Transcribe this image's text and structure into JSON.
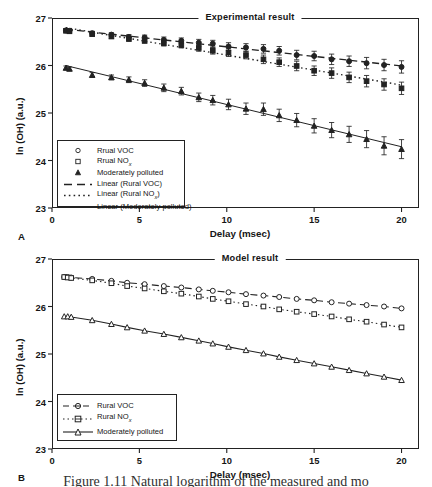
{
  "figure": {
    "caption_fragment": "Figure 1.11   Natural logarithm of the measured and mo"
  },
  "panels": [
    {
      "letter": "A",
      "title": "Experimental result",
      "xlabel": "Delay  (msec)",
      "ylabel": "ln (OH) (a.u.)",
      "xticks": [
        "0",
        "5",
        "10",
        "15",
        "20"
      ],
      "yticks": [
        "23",
        "24",
        "25",
        "26",
        "27"
      ],
      "legend": [
        {
          "text": "Rrual VOC",
          "sub": "",
          "key": "circle-marker"
        },
        {
          "text": "Rrual NO",
          "sub": "x",
          "key": "square-marker"
        },
        {
          "text": "Moderately polluted",
          "sub": "",
          "key": "triangle-marker"
        },
        {
          "text": "Linear (Rural VOC)",
          "sub": "",
          "key": "dashed-line"
        },
        {
          "text": "Linear (Rural NO",
          "sub": "x",
          "suffix": ")",
          "key": "dotted-line"
        },
        {
          "text": "Linear (Moderately polluted)",
          "sub": "",
          "key": "solid-line"
        }
      ]
    },
    {
      "letter": "B",
      "title": "Model result",
      "xlabel": "Delay  (msec)",
      "ylabel": "ln (OH) (a.u.)",
      "xticks": [
        "0",
        "5",
        "10",
        "15",
        "20"
      ],
      "yticks": [
        "23",
        "24",
        "25",
        "26",
        "27"
      ],
      "legend": [
        {
          "text": "Rural VOC",
          "sub": "",
          "key": "dashed-circle"
        },
        {
          "text": "Rural NO",
          "sub": "x",
          "key": "dotted-square"
        },
        {
          "text": "Moderately polluted",
          "sub": "",
          "key": "solid-triangle"
        }
      ]
    }
  ],
  "chart_data": [
    {
      "type": "scatter",
      "panel": "A",
      "title": "Experimental result",
      "xlabel": "Delay  (msec)",
      "ylabel": "ln (OH) (a.u.)",
      "xlim": [
        0,
        21
      ],
      "ylim": [
        23,
        27
      ],
      "xticks": [
        0,
        5,
        10,
        15,
        20
      ],
      "yticks": [
        23,
        24,
        25,
        26,
        27
      ],
      "grid": false,
      "legend_position": "lower-left",
      "errorbars": true,
      "series": [
        {
          "name": "Rrual VOC",
          "marker": "circle",
          "fit": "Linear (Rural VOC)",
          "fit_style": "dashed",
          "x": [
            0.8,
            1.0,
            2.3,
            3.4,
            4.4,
            5.3,
            6.4,
            7.4,
            8.4,
            9.2,
            10.1,
            11.1,
            12.1,
            13.0,
            14.0,
            15.0,
            16.0,
            17.0,
            18.0,
            19.0,
            20.0
          ],
          "y": [
            26.74,
            26.73,
            26.68,
            26.65,
            26.6,
            26.59,
            26.54,
            26.52,
            26.48,
            26.46,
            26.4,
            26.38,
            26.35,
            26.31,
            26.22,
            26.2,
            26.13,
            26.09,
            26.05,
            26.01,
            25.97
          ],
          "yerr": [
            0.03,
            0.03,
            0.04,
            0.04,
            0.05,
            0.05,
            0.06,
            0.06,
            0.07,
            0.07,
            0.08,
            0.08,
            0.09,
            0.09,
            0.1,
            0.1,
            0.11,
            0.11,
            0.12,
            0.12,
            0.13
          ]
        },
        {
          "name": "Rrual NOx",
          "marker": "square",
          "fit": "Linear (Rural NOx)",
          "fit_style": "dotted",
          "x": [
            0.8,
            1.0,
            2.3,
            3.4,
            4.4,
            5.3,
            6.4,
            7.4,
            8.4,
            9.2,
            10.1,
            11.1,
            12.1,
            13.0,
            14.0,
            15.0,
            16.0,
            17.0,
            18.0,
            19.0,
            20.0
          ],
          "y": [
            26.73,
            26.72,
            26.66,
            26.61,
            26.56,
            26.52,
            26.47,
            26.43,
            26.37,
            26.31,
            26.27,
            26.22,
            26.13,
            26.07,
            25.99,
            25.89,
            25.84,
            25.75,
            25.67,
            25.6,
            25.52
          ],
          "yerr": [
            0.03,
            0.03,
            0.04,
            0.04,
            0.05,
            0.05,
            0.06,
            0.06,
            0.07,
            0.07,
            0.08,
            0.08,
            0.09,
            0.09,
            0.1,
            0.1,
            0.11,
            0.11,
            0.12,
            0.12,
            0.13
          ]
        },
        {
          "name": "Moderately polluted",
          "marker": "triangle",
          "fit": "Linear (Moderately polluted)",
          "fit_style": "solid",
          "x": [
            0.8,
            1.0,
            2.3,
            3.4,
            4.4,
            5.3,
            6.4,
            7.4,
            8.4,
            9.2,
            10.1,
            11.1,
            12.1,
            13.0,
            14.0,
            15.0,
            16.0,
            17.0,
            18.0,
            19.0,
            20.0
          ],
          "y": [
            25.95,
            25.93,
            25.8,
            25.75,
            25.7,
            25.63,
            25.53,
            25.46,
            25.33,
            25.27,
            25.18,
            25.09,
            25.08,
            24.95,
            24.85,
            24.73,
            24.64,
            24.55,
            24.45,
            24.31,
            24.24
          ],
          "yerr": [
            0.04,
            0.04,
            0.05,
            0.05,
            0.06,
            0.07,
            0.08,
            0.08,
            0.09,
            0.1,
            0.11,
            0.12,
            0.13,
            0.13,
            0.14,
            0.15,
            0.16,
            0.17,
            0.18,
            0.19,
            0.2
          ]
        }
      ]
    },
    {
      "type": "line",
      "panel": "B",
      "title": "Model result",
      "xlabel": "Delay  (msec)",
      "ylabel": "ln (OH) (a.u.)",
      "xlim": [
        0,
        21
      ],
      "ylim": [
        23,
        27
      ],
      "xticks": [
        0,
        5,
        10,
        15,
        20
      ],
      "yticks": [
        23,
        24,
        25,
        26,
        27
      ],
      "grid": false,
      "legend_position": "lower-left",
      "errorbars": false,
      "series": [
        {
          "name": "Rural VOC",
          "marker": "circle",
          "line_style": "dashed",
          "x": [
            0.7,
            0.9,
            1.1,
            2.3,
            3.4,
            4.3,
            5.3,
            6.4,
            7.4,
            8.4,
            9.2,
            10.1,
            11.1,
            12.1,
            13.0,
            14.0,
            15.0,
            16.0,
            17.0,
            18.0,
            19.0,
            20.0
          ],
          "y": [
            26.62,
            26.62,
            26.61,
            26.58,
            26.54,
            26.5,
            26.47,
            26.43,
            26.4,
            26.36,
            26.33,
            26.3,
            26.26,
            26.23,
            26.2,
            26.16,
            26.13,
            26.09,
            26.06,
            26.03,
            26.0,
            25.96
          ]
        },
        {
          "name": "Rural NOx",
          "marker": "square",
          "line_style": "dotted",
          "x": [
            0.7,
            0.9,
            1.1,
            2.3,
            3.4,
            4.3,
            5.3,
            6.4,
            7.4,
            8.4,
            9.2,
            10.1,
            11.1,
            12.1,
            13.0,
            14.0,
            15.0,
            16.0,
            17.0,
            18.0,
            19.0,
            20.0
          ],
          "y": [
            26.62,
            26.61,
            26.6,
            26.55,
            26.49,
            26.43,
            26.38,
            26.32,
            26.27,
            26.21,
            26.16,
            26.11,
            26.05,
            26.0,
            25.94,
            25.89,
            25.84,
            25.79,
            25.73,
            25.68,
            25.62,
            25.56
          ]
        },
        {
          "name": "Moderately polluted",
          "marker": "triangle",
          "line_style": "solid",
          "x": [
            0.7,
            0.9,
            1.1,
            2.3,
            3.4,
            4.3,
            5.3,
            6.4,
            7.4,
            8.4,
            9.2,
            10.1,
            11.1,
            12.1,
            13.0,
            14.0,
            15.0,
            16.0,
            17.0,
            18.0,
            19.0,
            20.0
          ],
          "y": [
            25.79,
            25.79,
            25.78,
            25.71,
            25.63,
            25.56,
            25.49,
            25.42,
            25.35,
            25.28,
            25.22,
            25.15,
            25.08,
            25.01,
            24.94,
            24.87,
            24.8,
            24.73,
            24.66,
            24.59,
            24.52,
            24.45
          ]
        }
      ]
    }
  ]
}
